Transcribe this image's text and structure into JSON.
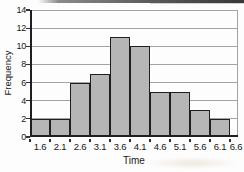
{
  "chart_data": {
    "type": "bar",
    "subtype": "histogram",
    "title": "",
    "xlabel": "Time",
    "ylabel": "Frequency",
    "x_tick_labels": [
      "1.6",
      "2.1",
      "2.6",
      "3.1",
      "3.6",
      "4.1",
      "4.6",
      "5.1",
      "5.6",
      "6.1",
      "6.6"
    ],
    "bin_edges": [
      1.6,
      2.1,
      2.6,
      3.1,
      3.6,
      4.1,
      4.6,
      5.1,
      5.6,
      6.1,
      6.6
    ],
    "values": [
      2,
      2,
      6,
      7,
      11,
      10,
      5,
      5,
      3,
      2
    ],
    "y_ticks": [
      0,
      2,
      4,
      6,
      8,
      10,
      12,
      14
    ],
    "ylim": [
      0,
      14
    ],
    "xlim": [
      1.6,
      6.6
    ],
    "grid": true,
    "legend": false
  },
  "style": {
    "background": "#fdfdfd",
    "bar_fill": "#b6b6b6",
    "bar_border": "#1f1f1f",
    "grid_color": "#a3a3a3",
    "axis_color": "#1f1f1f",
    "text_color": "#151515",
    "scan_strip_mid": "#8a8a8a",
    "scan_strip_dark": "#373737"
  }
}
